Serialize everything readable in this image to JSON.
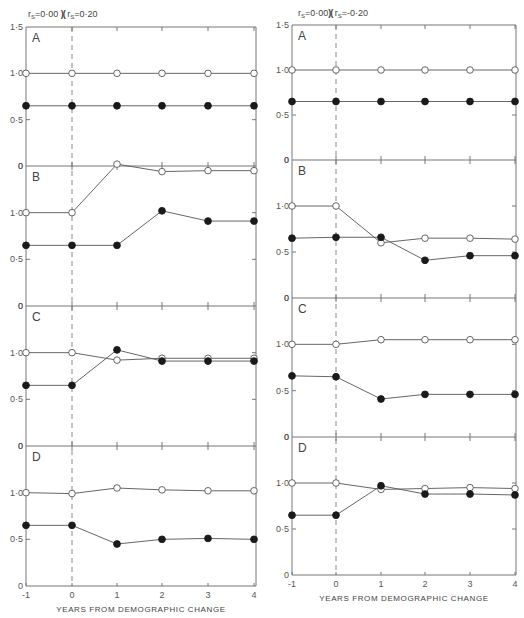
{
  "chart_data": [
    {
      "type": "line",
      "title": "rs=0·00 )( rs=0·20",
      "xlabel": "YEARS FROM DEMOGRAPHIC CHANGE",
      "x": [
        -1,
        0,
        1,
        2,
        3,
        4
      ],
      "x_tick_labels": [
        "-1",
        "0",
        "1",
        "2",
        "3",
        "4"
      ],
      "y_tick_labels": [
        "0",
        "0·5",
        "1·0",
        "1·5"
      ],
      "ylim": [
        0,
        1.5
      ],
      "vertical_marker": {
        "x": 0,
        "style": "dashed"
      },
      "panels": [
        {
          "label": "A",
          "series": [
            {
              "name": "open",
              "marker": "open-circle",
              "values": [
                1.0,
                1.0,
                1.0,
                1.0,
                1.0,
                1.0
              ]
            },
            {
              "name": "filled",
              "marker": "filled-circle",
              "values": [
                0.65,
                0.65,
                0.65,
                0.65,
                0.65,
                0.65
              ]
            }
          ]
        },
        {
          "label": "B",
          "series": [
            {
              "name": "open",
              "marker": "open-circle",
              "values": [
                1.0,
                1.0,
                1.52,
                1.44,
                1.45,
                1.45
              ]
            },
            {
              "name": "filled",
              "marker": "filled-circle",
              "values": [
                0.65,
                0.65,
                0.65,
                1.02,
                0.91,
                0.91
              ]
            }
          ]
        },
        {
          "label": "C",
          "series": [
            {
              "name": "open",
              "marker": "open-circle",
              "values": [
                1.0,
                1.0,
                0.92,
                0.94,
                0.94,
                0.94
              ]
            },
            {
              "name": "filled",
              "marker": "filled-circle",
              "values": [
                0.65,
                0.65,
                1.03,
                0.91,
                0.91,
                0.91
              ]
            }
          ]
        },
        {
          "label": "D",
          "series": [
            {
              "name": "open",
              "marker": "open-circle",
              "values": [
                1.0,
                0.99,
                1.05,
                1.03,
                1.02,
                1.02
              ]
            },
            {
              "name": "filled",
              "marker": "filled-circle",
              "values": [
                0.65,
                0.65,
                0.45,
                0.5,
                0.51,
                0.5
              ]
            }
          ]
        }
      ]
    },
    {
      "type": "line",
      "title": "rs=0·00 )( rs=-0·20",
      "xlabel": "YEARS FROM DEMOGRAPHIC CHANGE",
      "x": [
        -1,
        0,
        1,
        2,
        3,
        4
      ],
      "x_tick_labels": [
        "-1",
        "0",
        "1",
        "2",
        "3",
        "4"
      ],
      "y_tick_labels": [
        "0",
        "0·5",
        "1·0",
        "1·5"
      ],
      "ylim": [
        0,
        1.5
      ],
      "vertical_marker": {
        "x": 0,
        "style": "dashed"
      },
      "panels": [
        {
          "label": "A",
          "series": [
            {
              "name": "open",
              "marker": "open-circle",
              "values": [
                1.0,
                1.0,
                1.0,
                1.0,
                1.0,
                1.0
              ]
            },
            {
              "name": "filled",
              "marker": "filled-circle",
              "values": [
                0.65,
                0.65,
                0.65,
                0.65,
                0.65,
                0.65
              ]
            }
          ]
        },
        {
          "label": "B",
          "series": [
            {
              "name": "open",
              "marker": "open-circle",
              "values": [
                1.0,
                1.0,
                0.6,
                0.65,
                0.65,
                0.64
              ]
            },
            {
              "name": "filled",
              "marker": "filled-circle",
              "values": [
                0.65,
                0.66,
                0.66,
                0.41,
                0.46,
                0.46
              ]
            }
          ]
        },
        {
          "label": "C",
          "series": [
            {
              "name": "open",
              "marker": "open-circle",
              "values": [
                1.0,
                1.0,
                1.05,
                1.05,
                1.05,
                1.05
              ]
            },
            {
              "name": "filled",
              "marker": "filled-circle",
              "values": [
                0.66,
                0.65,
                0.41,
                0.46,
                0.46,
                0.46
              ]
            }
          ]
        },
        {
          "label": "D",
          "series": [
            {
              "name": "open",
              "marker": "open-circle",
              "values": [
                1.0,
                1.0,
                0.93,
                0.94,
                0.95,
                0.94
              ]
            },
            {
              "name": "filled",
              "marker": "filled-circle",
              "values": [
                0.65,
                0.65,
                0.97,
                0.88,
                0.88,
                0.87
              ]
            }
          ]
        }
      ]
    }
  ],
  "figure": {
    "left_title": {
      "pre": "r",
      "sub": "S",
      "a": "=0·00 ",
      "sep": ")(",
      "pre2": "r",
      "sub2": "S",
      "b": "=0·20"
    },
    "right_title": {
      "pre": "r",
      "sub": "S",
      "a": "=0·00",
      "sep": ")(",
      "pre2": "r",
      "sub2": "S",
      "b": "=-0·20"
    },
    "colors": {
      "line": "#555555",
      "axis": "#777777",
      "filled": "#1a1a1a",
      "open_fill": "#ffffff"
    }
  }
}
